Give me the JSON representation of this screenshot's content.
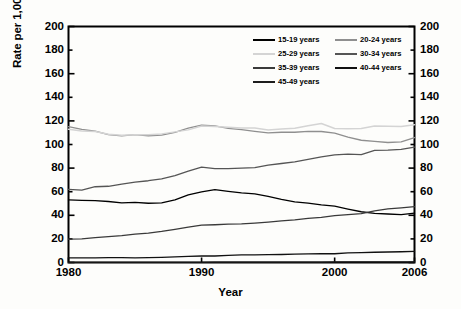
{
  "chart_data": {
    "type": "line",
    "title": "",
    "xlabel": "Year",
    "ylabel": "Rate per 1,000 women in specified age group",
    "ylabel_right": "Rate per 1,000 women in specified age group",
    "xlim": [
      1980,
      2006
    ],
    "ylim": [
      0,
      200
    ],
    "xticks": [
      1980,
      1990,
      2000,
      2006
    ],
    "yticks": [
      0,
      20,
      40,
      60,
      80,
      100,
      120,
      140,
      160,
      180,
      200
    ],
    "ytick_labels": [
      "0",
      "20",
      "40",
      "60",
      "80",
      "100",
      "120",
      "140",
      "160",
      "180",
      "200"
    ],
    "xtick_labels": [
      "1980",
      "1990",
      "2000",
      "2006"
    ],
    "grid": false,
    "dual_y_axis": true,
    "legend_position": "top-right",
    "x": [
      1980,
      1981,
      1982,
      1983,
      1984,
      1985,
      1986,
      1987,
      1988,
      1989,
      1990,
      1991,
      1992,
      1993,
      1994,
      1995,
      1996,
      1997,
      1998,
      1999,
      2000,
      2001,
      2002,
      2003,
      2004,
      2005,
      2006
    ],
    "series": [
      {
        "name": "15-19 years",
        "color": "#000000",
        "width": 1.3,
        "values": [
          53.0,
          52.7,
          52.4,
          51.7,
          50.6,
          51.0,
          50.2,
          50.6,
          53.0,
          57.3,
          59.9,
          61.8,
          60.3,
          59.0,
          58.2,
          56.0,
          53.5,
          51.3,
          50.3,
          48.8,
          47.7,
          45.3,
          43.0,
          41.6,
          41.1,
          40.5,
          41.9
        ]
      },
      {
        "name": "20-24 years",
        "color": "#8f8f8f",
        "width": 1.3,
        "values": [
          115.1,
          112.9,
          111.3,
          108.3,
          107.3,
          108.3,
          107.4,
          107.9,
          110.2,
          113.8,
          116.5,
          115.7,
          113.7,
          112.6,
          111.1,
          109.8,
          110.4,
          110.4,
          111.2,
          111.0,
          109.7,
          106.2,
          103.6,
          102.6,
          101.7,
          102.2,
          105.9
        ]
      },
      {
        "name": "25-29 years",
        "color": "#d4d4d4",
        "width": 1.5,
        "values": [
          112.9,
          111.5,
          111.0,
          108.7,
          107.8,
          108.3,
          108.2,
          109.0,
          110.7,
          112.4,
          115.7,
          115.3,
          114.6,
          113.9,
          113.9,
          112.2,
          113.1,
          113.8,
          115.9,
          117.8,
          113.5,
          113.4,
          113.6,
          115.6,
          115.5,
          115.2,
          116.8
        ]
      },
      {
        "name": "30-34 years",
        "color": "#555555",
        "width": 1.3,
        "values": [
          61.9,
          61.4,
          64.2,
          64.6,
          66.5,
          68.1,
          69.3,
          70.9,
          73.7,
          77.4,
          80.8,
          79.5,
          79.6,
          79.9,
          80.4,
          82.5,
          83.9,
          85.3,
          87.4,
          89.6,
          91.2,
          91.9,
          91.5,
          95.1,
          95.3,
          95.8,
          97.7
        ]
      },
      {
        "name": "35-39 years",
        "color": "#3a3a3a",
        "width": 1.3,
        "values": [
          19.8,
          20.0,
          21.1,
          21.9,
          22.8,
          24.0,
          24.9,
          26.3,
          28.1,
          29.9,
          31.7,
          32.0,
          32.5,
          32.7,
          33.4,
          34.3,
          35.3,
          36.1,
          37.4,
          38.3,
          39.7,
          40.6,
          41.4,
          43.8,
          45.4,
          46.3,
          47.3
        ]
      },
      {
        "name": "40-44 years",
        "color": "#111111",
        "width": 1.3,
        "values": [
          3.9,
          3.9,
          4.0,
          4.1,
          4.2,
          4.0,
          4.1,
          4.4,
          4.8,
          5.2,
          5.5,
          5.5,
          6.1,
          6.5,
          6.4,
          6.6,
          6.8,
          7.1,
          7.3,
          7.4,
          7.4,
          8.1,
          8.3,
          8.7,
          8.9,
          9.1,
          9.4
        ]
      },
      {
        "name": "45-49 years",
        "color": "#1d1d1d",
        "width": 1.2,
        "values": [
          0.2,
          0.2,
          0.2,
          0.2,
          0.2,
          0.2,
          0.2,
          0.2,
          0.2,
          0.2,
          0.2,
          0.3,
          0.3,
          0.3,
          0.3,
          0.3,
          0.3,
          0.4,
          0.4,
          0.4,
          0.5,
          0.5,
          0.5,
          0.5,
          0.5,
          0.6,
          0.6
        ]
      }
    ]
  },
  "axes": {
    "y_title": "Rate per 1,000 women in specified age group",
    "x_title": "Year",
    "y_ticks_left": [
      "200",
      "180",
      "160",
      "140",
      "120",
      "100",
      "80",
      "60",
      "40",
      "20",
      "0"
    ],
    "y_ticks_right": [
      "200",
      "180",
      "160",
      "140",
      "120",
      "100",
      "80",
      "60",
      "40",
      "20",
      "0"
    ],
    "x_ticks": [
      "1980",
      "1990",
      "2000",
      "2006"
    ]
  },
  "legend": {
    "rows": [
      [
        {
          "label": "15-19 years",
          "color": "#000000"
        },
        {
          "label": "20-24 years",
          "color": "#8f8f8f"
        }
      ],
      [
        {
          "label": "25-29 years",
          "color": "#d4d4d4"
        },
        {
          "label": "30-34 years",
          "color": "#555555"
        }
      ],
      [
        {
          "label": "35-39 years",
          "color": "#3a3a3a"
        },
        {
          "label": "40-44 years",
          "color": "#111111"
        }
      ],
      [
        {
          "label": "45-49 years",
          "color": "#1d1d1d"
        }
      ]
    ]
  }
}
